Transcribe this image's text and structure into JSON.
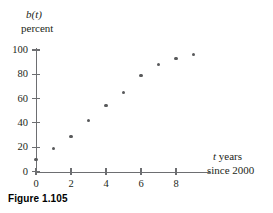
{
  "figure": {
    "caption": "Figure 1.105"
  },
  "chart_data": {
    "type": "scatter",
    "title": "",
    "subtitle": "",
    "xlabel": "t years since 2000",
    "xlabel_parts": {
      "variable": "t",
      "line1_rest": " years",
      "line2": "since 2000"
    },
    "ylabel": "b(t) percent",
    "ylabel_parts": {
      "function": "b(t)",
      "units": "percent"
    },
    "x": [
      0,
      1,
      2,
      3,
      4,
      5,
      6,
      7,
      8,
      9
    ],
    "y": [
      10,
      19,
      29,
      42,
      54,
      65,
      79,
      88,
      93,
      96
    ],
    "xlim": [
      0,
      10
    ],
    "ylim": [
      0,
      104
    ],
    "xticks": [
      0,
      2,
      4,
      6,
      8
    ],
    "xtick_labels": [
      "0",
      "2",
      "4",
      "6",
      "8"
    ],
    "yticks": [
      0,
      20,
      40,
      60,
      80,
      100
    ],
    "ytick_labels": [
      "0",
      "20",
      "40",
      "60",
      "80",
      "100"
    ],
    "grid": false,
    "legend": null,
    "marker_color": "#58595b",
    "axis_color": "#6d6e71"
  }
}
